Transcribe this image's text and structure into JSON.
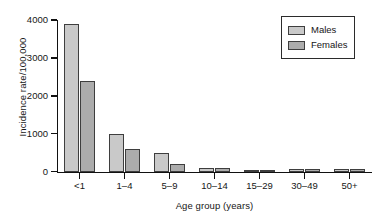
{
  "chart_data": {
    "type": "bar",
    "title": "",
    "xlabel": "Age group (years)",
    "ylabel": "Incidence rate/100,000",
    "categories": [
      "<1",
      "1–4",
      "5–9",
      "10–14",
      "15–29",
      "30–49",
      "50+"
    ],
    "series": [
      {
        "name": "Males",
        "color": "#c9c9c9",
        "values": [
          3900,
          1000,
          500,
          90,
          60,
          80,
          70
        ]
      },
      {
        "name": "Females",
        "color": "#acacac",
        "values": [
          2400,
          600,
          200,
          90,
          60,
          80,
          70
        ]
      }
    ],
    "ylim": [
      0,
      4000
    ],
    "yticks": [
      0,
      1000,
      2000,
      3000,
      4000
    ],
    "ytick_labels": [
      "0",
      "1000",
      "2000",
      "3000",
      "4000"
    ],
    "grid": false,
    "legend_position": "top-right",
    "bar_edge_color": "#3e3e3e",
    "axis_color": "#111111"
  },
  "legend": {
    "entries": [
      {
        "label": "Males"
      },
      {
        "label": "Females"
      }
    ]
  }
}
